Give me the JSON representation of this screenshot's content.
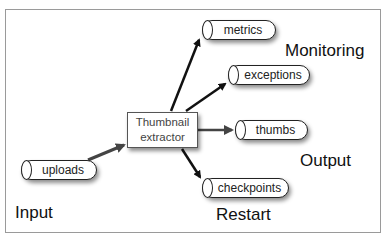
{
  "diagram": {
    "processor": {
      "line1": "Thumbnail",
      "line2": "extractor"
    },
    "queues": {
      "uploads": "uploads",
      "metrics": "metrics",
      "exceptions": "exceptions",
      "thumbs": "thumbs",
      "checkpoints": "checkpoints"
    },
    "zones": {
      "input": "Input",
      "monitoring": "Monitoring",
      "output": "Output",
      "restart": "Restart"
    },
    "edges": [
      {
        "from": "uploads",
        "to": "Thumbnail extractor"
      },
      {
        "from": "Thumbnail extractor",
        "to": "metrics"
      },
      {
        "from": "Thumbnail extractor",
        "to": "exceptions"
      },
      {
        "from": "Thumbnail extractor",
        "to": "thumbs"
      },
      {
        "from": "Thumbnail extractor",
        "to": "checkpoints"
      }
    ]
  }
}
